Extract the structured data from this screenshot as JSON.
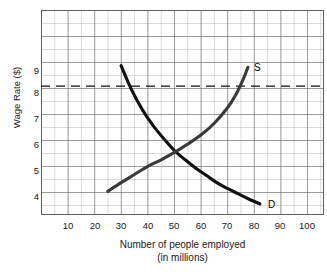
{
  "chart_data": {
    "type": "line",
    "title": "",
    "xlabel": "Number of people employed",
    "xlabel_sub": "(in millions)",
    "ylabel": "Wage Rate ($)",
    "xlim": [
      0,
      106
    ],
    "ylim": [
      3.1,
      10.9
    ],
    "xticks": [
      10,
      20,
      30,
      40,
      50,
      60,
      70,
      80,
      90,
      100
    ],
    "yticks": [
      4,
      5,
      6,
      7,
      8,
      9
    ],
    "grid": true,
    "grid_minor_step_x": 5,
    "grid_minor_step_y": 0.5,
    "legend": "none",
    "series": [
      {
        "name": "D",
        "label": "D",
        "description": "Demand curve, downward sloping",
        "color": "#111111",
        "points": [
          [
            30,
            8.78
          ],
          [
            34,
            7.85
          ],
          [
            38,
            7.1
          ],
          [
            42,
            6.5
          ],
          [
            46,
            6.0
          ],
          [
            50,
            5.55
          ],
          [
            54,
            5.2
          ],
          [
            58,
            4.88
          ],
          [
            62,
            4.6
          ],
          [
            66,
            4.32
          ],
          [
            70,
            4.1
          ],
          [
            74,
            3.9
          ],
          [
            78,
            3.7
          ],
          [
            82,
            3.52
          ]
        ]
      },
      {
        "name": "S",
        "label": "S",
        "description": "Supply curve, upward sloping",
        "color": "#3a3a3a",
        "points": [
          [
            25,
            4.0
          ],
          [
            30,
            4.33
          ],
          [
            35,
            4.64
          ],
          [
            40,
            4.95
          ],
          [
            45,
            5.2
          ],
          [
            50,
            5.48
          ],
          [
            55,
            5.8
          ],
          [
            60,
            6.15
          ],
          [
            65,
            6.6
          ],
          [
            70,
            7.2
          ],
          [
            73,
            7.68
          ],
          [
            75,
            8.1
          ],
          [
            76.5,
            8.45
          ],
          [
            77.5,
            8.72
          ]
        ]
      }
    ],
    "annotations": [
      {
        "name": "equilibrium",
        "type": "intersection",
        "x": 49,
        "y": 5.4,
        "note": "Intersection of supply and demand"
      },
      {
        "name": "wage-reference-line",
        "type": "hline",
        "y": 8,
        "style": "dashed",
        "color": "#111111",
        "note": "Dashed horizontal reference line at $8 wage rate"
      }
    ]
  },
  "axis": {
    "y_title": "Wage Rate ($)",
    "y_tick_labels": [
      "9",
      "8",
      "7",
      "6",
      "5",
      "4"
    ],
    "x_title_line1": "Number of people employed",
    "x_title_line2": "(in millions)",
    "x_tick_labels": [
      "10",
      "20",
      "30",
      "40",
      "50",
      "60",
      "70",
      "80",
      "90",
      "100"
    ]
  },
  "curve_labels": {
    "supply": "S",
    "demand": "D"
  },
  "colors": {
    "grid_minor": "#b9b9b9",
    "grid_major": "#5e5e5e",
    "demand_curve": "#111111",
    "supply_curve": "#3a3a3a",
    "dashed_line": "#111111",
    "text": "#1a1a1a",
    "background": "#ffffff"
  }
}
